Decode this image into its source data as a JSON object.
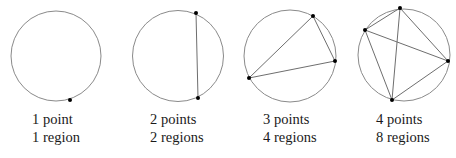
{
  "panels": [
    {
      "circle": {
        "cx": 56,
        "cy": 56,
        "r": 45
      },
      "points": [
        [
          70,
          100
        ]
      ],
      "chords": [],
      "label_points": "1 point",
      "label_regions": "1 region",
      "label_x": 32
    },
    {
      "circle": {
        "cx": 178,
        "cy": 56,
        "r": 45.5
      },
      "points": [
        [
          196,
          13
        ],
        [
          198,
          98
        ]
      ],
      "chords": [
        [
          0,
          1
        ]
      ],
      "label_points": "2 points",
      "label_regions": "2 regions",
      "label_x": 150
    },
    {
      "circle": {
        "cx": 290,
        "cy": 56,
        "r": 46
      },
      "points": [
        [
          313,
          16
        ],
        [
          335,
          61
        ],
        [
          249,
          78
        ]
      ],
      "chords": [
        [
          0,
          1
        ],
        [
          1,
          2
        ],
        [
          2,
          0
        ]
      ],
      "label_points": "3 points",
      "label_regions": "4 regions",
      "label_x": 263
    },
    {
      "circle": {
        "cx": 404,
        "cy": 55,
        "r": 46
      },
      "points": [
        [
          400,
          8
        ],
        [
          365,
          30
        ],
        [
          448,
          61
        ],
        [
          392,
          100
        ]
      ],
      "chords": [
        [
          0,
          1
        ],
        [
          0,
          2
        ],
        [
          0,
          3
        ],
        [
          1,
          2
        ],
        [
          1,
          3
        ],
        [
          2,
          3
        ]
      ],
      "label_points": "4 points",
      "label_regions": "8 regions",
      "label_x": 376
    }
  ],
  "style": {
    "circle_color": "#8a8a8a",
    "chord_color": "#6e6e6e",
    "point_color": "#000000"
  }
}
